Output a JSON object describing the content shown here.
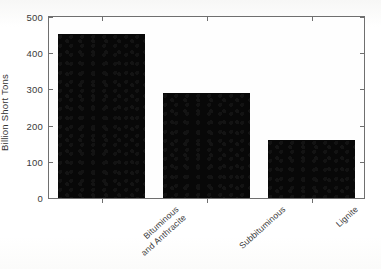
{
  "chart_data": {
    "type": "bar",
    "title": "",
    "subtitle": "",
    "xlabel": "",
    "ylabel": "Billion Short Tons",
    "categories": [
      "Bituminous and Anthracite",
      "Subbituminous",
      "Lignite"
    ],
    "category_lines": [
      [
        "Bituminous",
        "and Anthracite"
      ],
      [
        "Subbituminous"
      ],
      [
        "Lignite"
      ]
    ],
    "values": [
      453,
      290,
      161
    ],
    "ylim": [
      0,
      500
    ],
    "yticks": [
      0,
      100,
      200,
      300,
      400,
      500
    ],
    "ytick_labels": [
      "0",
      "100",
      "200",
      "300",
      "400",
      "500"
    ],
    "grid": false,
    "legend": null,
    "legend_position": "none",
    "bar_color": "#080808",
    "axis_color": "#6f6f6f",
    "background_color": "#fdfdfd",
    "annotations": []
  },
  "figure": {
    "axis_label_rotation_deg": -42,
    "y_axis_title_rotation_deg": -90
  }
}
